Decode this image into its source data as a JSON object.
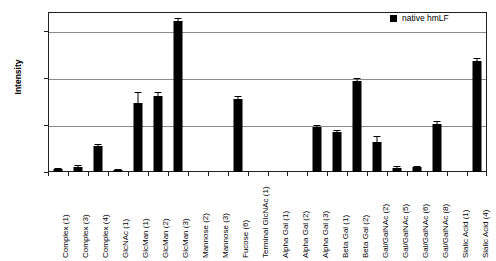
{
  "chart_data": {
    "type": "bar",
    "title": "",
    "subtitle": "",
    "xlabel": "",
    "ylabel": "Intensity",
    "ylim": [
      0,
      6800
    ],
    "yticks": [
      0,
      2000,
      4000,
      6000
    ],
    "ytick_labels": [
      "0",
      "2000",
      "4000",
      "6000"
    ],
    "grid": true,
    "legend_position": "top-right",
    "legend": [
      "native hmLF"
    ],
    "categories": [
      "Complex (1)",
      "Complex (3)",
      "Complex (4)",
      "GlcNAc (1)",
      "GlcMan (1)",
      "GlcMan (2)",
      "GlcMan (3)",
      "Mannose (2)",
      "Mannose (3)",
      "Fucose (6)",
      "Terminal GlcNAc (1)",
      "Alpha Gal (1)",
      "Alpha Gal (2)",
      "Alpha Gal (3)",
      "Beta Gal (1)",
      "Beta Gal (2)",
      "Gal/GalNAc (2)",
      "Gal/GalNAc (5)",
      "Gal/GalNAc (6)",
      "Gal/GalNAc (8)",
      "Sialic Acid (1)",
      "Sialic Acid (4)"
    ],
    "series": [
      {
        "name": "native hmLF",
        "color": "#000000",
        "values": [
          130,
          230,
          1100,
          90,
          2950,
          3230,
          6400,
          0,
          0,
          3100,
          0,
          0,
          0,
          1900,
          1680,
          3880,
          1280,
          190,
          200,
          2050,
          0,
          4700
        ],
        "errors": [
          40,
          60,
          70,
          30,
          430,
          180,
          130,
          0,
          0,
          150,
          0,
          0,
          0,
          110,
          90,
          110,
          230,
          50,
          50,
          130,
          0,
          140
        ]
      }
    ]
  }
}
